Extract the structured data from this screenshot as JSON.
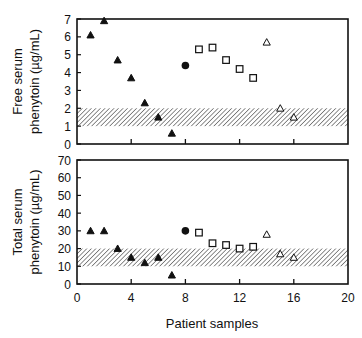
{
  "chart_data": [
    {
      "type": "scatter",
      "panel": "top",
      "title": "",
      "xlabel": "",
      "ylabel": "Free serum phenytoin (µg/mL)",
      "ylabel_lines": [
        "Free serum",
        "phenytoin (µg/mL)"
      ],
      "xlim": [
        0,
        20
      ],
      "ylim": [
        0,
        7
      ],
      "yticks": [
        0,
        1,
        2,
        3,
        4,
        5,
        6,
        7
      ],
      "xticks": [
        4,
        8,
        12,
        16
      ],
      "grid": false,
      "shaded_band": {
        "from": 1,
        "to": 2,
        "label": "therapeutic range"
      },
      "series": [
        {
          "name": "filled-triangle",
          "marker": "triangle-filled",
          "x": [
            1,
            2,
            3,
            4,
            5,
            6,
            7
          ],
          "y": [
            6.1,
            6.9,
            4.7,
            3.7,
            2.3,
            1.5,
            0.6
          ]
        },
        {
          "name": "filled-circle",
          "marker": "circle-filled",
          "x": [
            8
          ],
          "y": [
            4.4
          ]
        },
        {
          "name": "open-square",
          "marker": "square-open",
          "x": [
            9,
            10,
            11,
            12,
            13
          ],
          "y": [
            5.3,
            5.4,
            4.7,
            4.2,
            3.7
          ]
        },
        {
          "name": "open-triangle",
          "marker": "triangle-open",
          "x": [
            14,
            15,
            16
          ],
          "y": [
            5.7,
            2.0,
            1.5
          ]
        }
      ]
    },
    {
      "type": "scatter",
      "panel": "bottom",
      "title": "",
      "xlabel": "Patient samples",
      "ylabel": "Total serum phenytoin (µg/mL)",
      "ylabel_lines": [
        "Total serum",
        "phenytoin (µg/mL)"
      ],
      "xlim": [
        0,
        20
      ],
      "ylim": [
        0,
        70
      ],
      "yticks": [
        0,
        10,
        20,
        30,
        40,
        50,
        60,
        70
      ],
      "xticks": [
        0,
        4,
        8,
        12,
        16,
        20
      ],
      "grid": false,
      "shaded_band": {
        "from": 10,
        "to": 20,
        "label": "therapeutic range"
      },
      "series": [
        {
          "name": "filled-triangle",
          "marker": "triangle-filled",
          "x": [
            1,
            2,
            3,
            4,
            5,
            6,
            7
          ],
          "y": [
            30,
            30,
            20,
            15,
            12,
            15,
            5
          ]
        },
        {
          "name": "filled-circle",
          "marker": "circle-filled",
          "x": [
            8
          ],
          "y": [
            30
          ]
        },
        {
          "name": "open-square",
          "marker": "square-open",
          "x": [
            9,
            10,
            11,
            12,
            13
          ],
          "y": [
            29,
            23,
            22,
            20,
            21
          ]
        },
        {
          "name": "open-triangle",
          "marker": "triangle-open",
          "x": [
            14,
            15,
            16
          ],
          "y": [
            28,
            17,
            15
          ]
        }
      ]
    }
  ],
  "layout": {
    "panels": [
      {
        "left": 77,
        "right": 348,
        "top": 19,
        "bottom": 144
      },
      {
        "left": 77,
        "right": 348,
        "top": 160,
        "bottom": 284
      }
    ],
    "colors": {
      "axis": "#111111",
      "marker": "#111111",
      "hatch": "#333333",
      "background": "#ffffff"
    }
  }
}
